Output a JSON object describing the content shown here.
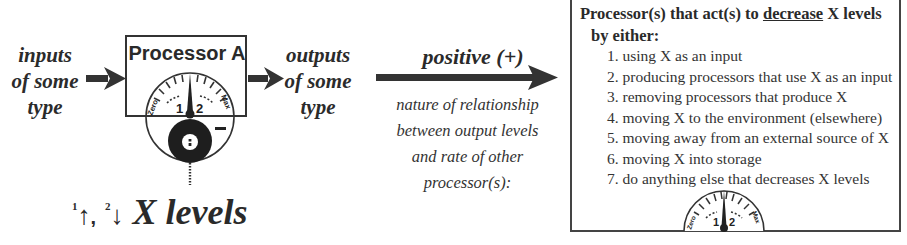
{
  "diagram": {
    "inputs_label": [
      "inputs",
      "of some",
      "type"
    ],
    "processor": {
      "title": "Processor A",
      "gauge": {
        "left_label": "Zero",
        "right_label": "Max",
        "mark_1": "1",
        "mark_2": "2",
        "sign": "−"
      }
    },
    "outputs_label": [
      "outputs",
      "of some",
      "type"
    ],
    "x_levels": {
      "up_index": "1",
      "up_arrow": "↑",
      "separator": ",",
      "down_index": "2",
      "down_arrow": "↓",
      "label": "X levels"
    },
    "relationship": {
      "label": "positive (+)",
      "description": [
        "nature of relationship",
        "between output levels",
        "and rate of other",
        "processor(s):"
      ]
    },
    "decrease_box": {
      "heading_before": "Processor(s) that act(s) to ",
      "heading_underlined": "decrease",
      "heading_after": " X levels",
      "subheading": "by either:",
      "items": [
        "1. using X as an input",
        "2. producing processors that use X as an input",
        "3. removing processors that produce X",
        "4. moving X to the environment (elsewhere)",
        "5. moving away from an external source of X",
        "6. moving X into storage",
        "7. do anything else that decreases X levels"
      ],
      "gauge": {
        "left_label": "Zero",
        "right_label": "Max",
        "mark_1": "1",
        "mark_2": "2"
      }
    },
    "colors": {
      "ink": "#2a2a2a",
      "background": "#ffffff"
    }
  }
}
